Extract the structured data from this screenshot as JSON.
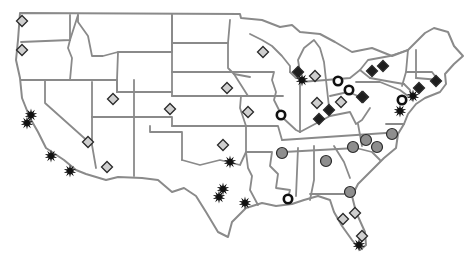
{
  "map": {
    "region": "Contiguous United States",
    "colors": {
      "border": "#8a8a8a",
      "diamond_light_fill": "#cfcfcf",
      "diamond_dark_fill": "#1e1e1e",
      "circle_gray_fill": "#8e8e8e",
      "ring_stroke": "#111111",
      "star_fill": "#111111",
      "marker_stroke": "#2a2a2a"
    },
    "marker_types": [
      {
        "type": "diamond-light",
        "icon": "light-diamond-icon"
      },
      {
        "type": "diamond-dark",
        "icon": "dark-diamond-icon"
      },
      {
        "type": "circle-gray",
        "icon": "gray-circle-icon"
      },
      {
        "type": "ring",
        "icon": "ring-icon"
      },
      {
        "type": "star",
        "icon": "starburst-icon"
      }
    ],
    "markers": [
      {
        "type": "diamond-light",
        "x": 22,
        "y": 21
      },
      {
        "type": "diamond-light",
        "x": 22,
        "y": 50
      },
      {
        "type": "diamond-light",
        "x": 263,
        "y": 52
      },
      {
        "type": "diamond-light",
        "x": 113,
        "y": 99
      },
      {
        "type": "diamond-light",
        "x": 227,
        "y": 88
      },
      {
        "type": "diamond-light",
        "x": 170,
        "y": 109
      },
      {
        "type": "diamond-light",
        "x": 248,
        "y": 112
      },
      {
        "type": "diamond-light",
        "x": 88,
        "y": 142
      },
      {
        "type": "diamond-light",
        "x": 107,
        "y": 167
      },
      {
        "type": "diamond-light",
        "x": 223,
        "y": 145
      },
      {
        "type": "diamond-light",
        "x": 315,
        "y": 76
      },
      {
        "type": "diamond-light",
        "x": 317,
        "y": 103
      },
      {
        "type": "diamond-light",
        "x": 341,
        "y": 102
      },
      {
        "type": "diamond-light",
        "x": 343,
        "y": 219
      },
      {
        "type": "diamond-light",
        "x": 355,
        "y": 213
      },
      {
        "type": "diamond-light",
        "x": 362,
        "y": 236
      },
      {
        "type": "diamond-dark",
        "x": 298,
        "y": 72
      },
      {
        "type": "diamond-dark",
        "x": 329,
        "y": 110
      },
      {
        "type": "diamond-dark",
        "x": 319,
        "y": 119
      },
      {
        "type": "diamond-dark",
        "x": 363,
        "y": 97
      },
      {
        "type": "diamond-dark",
        "x": 372,
        "y": 71
      },
      {
        "type": "diamond-dark",
        "x": 383,
        "y": 66
      },
      {
        "type": "diamond-dark",
        "x": 362,
        "y": 97
      },
      {
        "type": "diamond-dark",
        "x": 419,
        "y": 88
      },
      {
        "type": "diamond-dark",
        "x": 436,
        "y": 81
      },
      {
        "type": "circle-gray",
        "x": 282,
        "y": 153
      },
      {
        "type": "circle-gray",
        "x": 326,
        "y": 161
      },
      {
        "type": "circle-gray",
        "x": 353,
        "y": 147
      },
      {
        "type": "circle-gray",
        "x": 366,
        "y": 140
      },
      {
        "type": "circle-gray",
        "x": 377,
        "y": 147
      },
      {
        "type": "circle-gray",
        "x": 392,
        "y": 134
      },
      {
        "type": "circle-gray",
        "x": 350,
        "y": 192
      },
      {
        "type": "ring",
        "x": 338,
        "y": 81
      },
      {
        "type": "ring",
        "x": 349,
        "y": 90
      },
      {
        "type": "ring",
        "x": 281,
        "y": 115
      },
      {
        "type": "ring",
        "x": 288,
        "y": 199
      },
      {
        "type": "ring",
        "x": 402,
        "y": 100
      },
      {
        "type": "star",
        "x": 302,
        "y": 80
      },
      {
        "type": "star",
        "x": 31,
        "y": 115
      },
      {
        "type": "star",
        "x": 27,
        "y": 123
      },
      {
        "type": "star",
        "x": 51,
        "y": 156
      },
      {
        "type": "star",
        "x": 70,
        "y": 171
      },
      {
        "type": "star",
        "x": 230,
        "y": 162
      },
      {
        "type": "star",
        "x": 223,
        "y": 189
      },
      {
        "type": "star",
        "x": 219,
        "y": 197
      },
      {
        "type": "star",
        "x": 245,
        "y": 203
      },
      {
        "type": "star",
        "x": 413,
        "y": 96
      },
      {
        "type": "star",
        "x": 400,
        "y": 111
      },
      {
        "type": "star",
        "x": 359,
        "y": 245
      }
    ]
  }
}
